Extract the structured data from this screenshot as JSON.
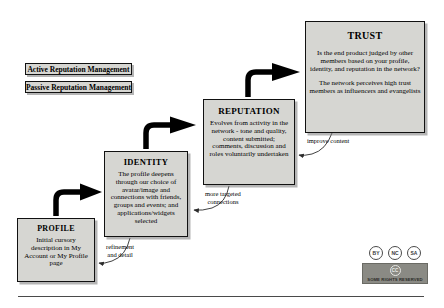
{
  "diagram": {
    "legend": [
      {
        "label": "Active Reputation Management",
        "type": "active"
      },
      {
        "label": "Passive Reputation Management",
        "type": "passive"
      }
    ],
    "stages": [
      {
        "id": "profile",
        "title": "PROFILE",
        "body": "Initial cursory description in My Account or My Profile page",
        "body2": ""
      },
      {
        "id": "identity",
        "title": "IDENTITY",
        "body": "The profile deepens through our choice of avatar/image and connections with friends, groups and events; and applications/widgets selected",
        "body2": ""
      },
      {
        "id": "reputation",
        "title": "REPUTATION",
        "body": "Evolves from activity in the network - tone and quality, content submitted; comments, discussion and roles voluntarily undertaken",
        "body2": ""
      },
      {
        "id": "trust",
        "title": "TRUST",
        "body": "Is the end product judged by other members based on your profile, identity, and reputation in the network?",
        "body2": "The network perceives high trust members as influencers and evangelists"
      }
    ],
    "feedback_labels": [
      {
        "id": "improve-content",
        "line1": "improve content",
        "line2": ""
      },
      {
        "id": "more-targeted-connections",
        "line1": "more targeted",
        "line2": "connections"
      },
      {
        "id": "refinement-and-detail",
        "line1": "refinement",
        "line2": "and detail"
      }
    ],
    "license": {
      "icons": [
        "BY",
        "NC",
        "SA"
      ],
      "logo_text": "CC",
      "banner_text": "SOME RIGHTS RESERVED"
    },
    "colors": {
      "box_fill": "#d6d6d2",
      "box_border": "#111111",
      "arrow": "#000000",
      "banner": "#8a8a84"
    }
  }
}
